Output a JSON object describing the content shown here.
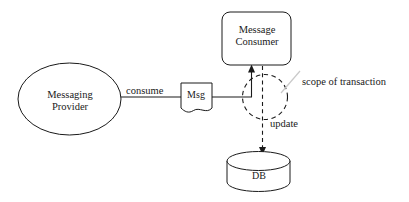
{
  "diagram": {
    "background_color": "#ffffff",
    "stroke_color": "#1a1a1a",
    "leader_color": "#c9c9c9",
    "nodes": [
      {
        "id": "messaging-provider",
        "shape": "ellipse",
        "label_line_1": "Messaging",
        "label_line_2": "Provider",
        "label": "Messaging Provider"
      },
      {
        "id": "message-consumer",
        "shape": "rounded-rectangle",
        "label_line_1": "Message",
        "label_line_2": "Consumer",
        "label": "Message Consumer"
      },
      {
        "id": "msg",
        "shape": "document",
        "label": "Msg"
      },
      {
        "id": "db",
        "shape": "cylinder",
        "label": "DB"
      }
    ],
    "edges": [
      {
        "id": "consume",
        "label": "consume",
        "from": "messaging-provider",
        "to": "msg",
        "style": "solid",
        "arrow": false
      },
      {
        "id": "msg-to-consumer",
        "label": "",
        "from": "msg",
        "to": "message-consumer",
        "style": "solid",
        "arrow": true
      },
      {
        "id": "update",
        "label": "update",
        "from": "message-consumer",
        "to": "db",
        "style": "dashed",
        "arrow": true
      }
    ],
    "annotations": [
      {
        "id": "scope-of-transaction",
        "label": "scope of transaction",
        "target": "transaction-scope-circle",
        "style": "dashed-circle"
      }
    ]
  }
}
